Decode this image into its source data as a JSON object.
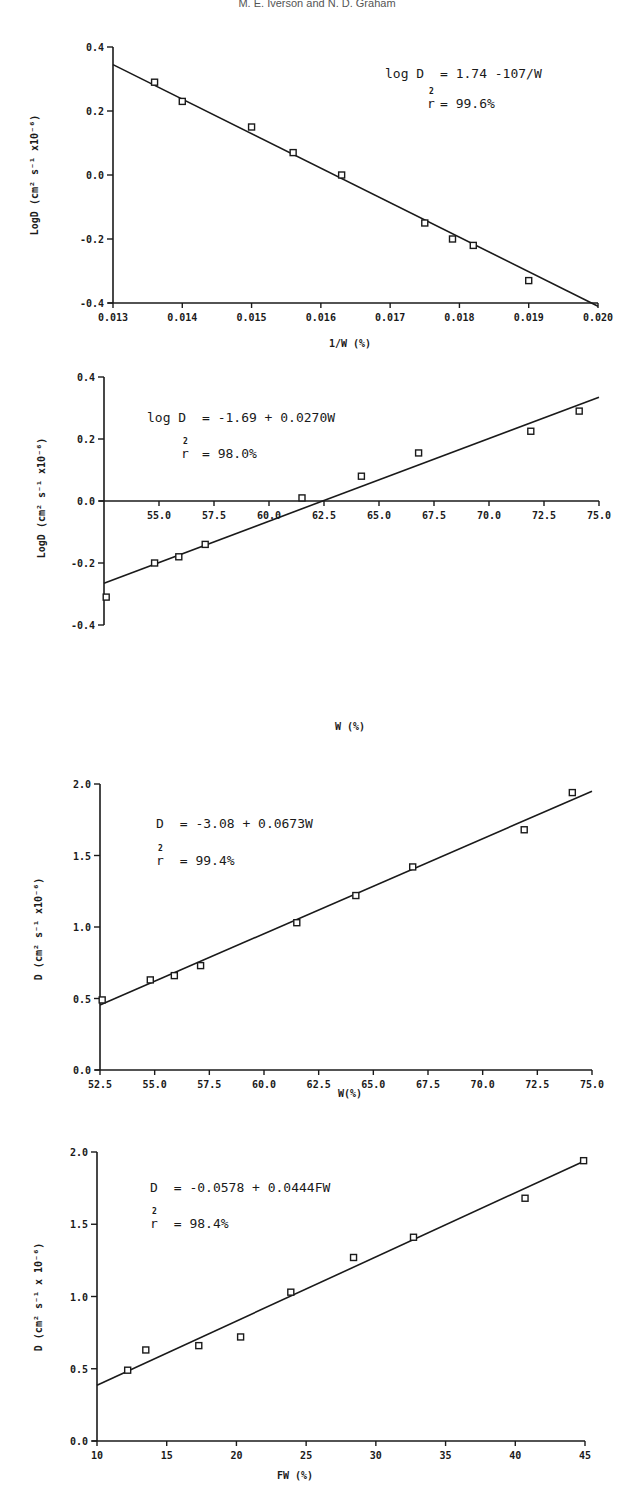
{
  "page": {
    "header_text": "M. E. Iverson and N. D. Graham"
  },
  "chart_data": [
    {
      "type": "scatter",
      "title": "",
      "xlabel": "1/W (%)",
      "ylabel": "LogD (cm² s⁻¹ x10⁻⁶)",
      "xlim": [
        0.013,
        0.02
      ],
      "ylim": [
        -0.4,
        0.4
      ],
      "xticks": [
        0.013,
        0.014,
        0.015,
        0.016,
        0.017,
        0.018,
        0.019,
        0.02
      ],
      "xtick_labels": [
        "0.013",
        "0.014",
        "0.015",
        "0.016",
        "0.017",
        "0.018",
        "0.019",
        "0.020"
      ],
      "yticks": [
        -0.4,
        -0.2,
        0.0,
        0.2,
        0.4
      ],
      "ytick_labels": [
        "-0.4",
        "-0.2",
        "0.0",
        "0.2",
        "0.4"
      ],
      "x_axis_at": -0.4,
      "grid": false,
      "points": {
        "x": [
          0.0136,
          0.014,
          0.015,
          0.0156,
          0.0163,
          0.0175,
          0.0179,
          0.0182,
          0.019
        ],
        "y": [
          0.29,
          0.23,
          0.15,
          0.07,
          0.0,
          -0.15,
          -0.2,
          -0.22,
          -0.33
        ]
      },
      "fit_line": {
        "x": [
          0.013,
          0.02
        ],
        "y": [
          0.345,
          -0.41
        ]
      },
      "annotation": {
        "eq_lhs": "log D",
        "eq_rhs": "= 1.74 -107/W",
        "r2_label": "r",
        "r2_sup": "2",
        "r2_value": "= 99.6%",
        "placement": "top-right"
      }
    },
    {
      "type": "scatter",
      "title": "",
      "xlabel": "W (%)",
      "ylabel": "LogD (cm² s⁻¹ x10⁻⁶)",
      "xlim": [
        52.5,
        75.0
      ],
      "ylim": [
        -0.4,
        0.4
      ],
      "xticks": [
        55.0,
        57.5,
        60.0,
        62.5,
        65.0,
        67.5,
        70.0,
        72.5,
        75.0
      ],
      "xtick_labels": [
        "55.0",
        "57.5",
        "60.0",
        "62.5",
        "65.0",
        "67.5",
        "70.0",
        "72.5",
        "75.0"
      ],
      "yticks": [
        -0.4,
        -0.2,
        0.0,
        0.2,
        0.4
      ],
      "ytick_labels": [
        "-0.4",
        "-0.2",
        "0.0",
        "0.2",
        "0.4"
      ],
      "x_axis_at": 0.0,
      "grid": false,
      "points": {
        "x": [
          52.6,
          54.8,
          55.9,
          57.1,
          61.5,
          64.2,
          66.8,
          71.9,
          74.1
        ],
        "y": [
          -0.31,
          -0.2,
          -0.18,
          -0.14,
          0.01,
          0.08,
          0.155,
          0.225,
          0.29
        ]
      },
      "fit_line": {
        "x": [
          52.5,
          75.0
        ],
        "y": [
          -0.265,
          0.335
        ]
      },
      "annotation": {
        "eq_lhs": "log D",
        "eq_rhs": "= -1.69 + 0.0270W",
        "r2_label": "r",
        "r2_sup": "2",
        "r2_value": "= 98.0%",
        "placement": "top-left"
      }
    },
    {
      "type": "scatter",
      "title": "",
      "xlabel": "W(%)",
      "ylabel": "D (cm² s⁻¹ x10⁻⁶)",
      "xlim": [
        52.5,
        75.0
      ],
      "ylim": [
        0.0,
        2.0
      ],
      "xticks": [
        52.5,
        55.0,
        57.5,
        60.0,
        62.5,
        65.0,
        67.5,
        70.0,
        72.5,
        75.0
      ],
      "xtick_labels": [
        "52.5",
        "55.0",
        "57.5",
        "60.0",
        "62.5",
        "65.0",
        "67.5",
        "70.0",
        "72.5",
        "75.0"
      ],
      "yticks": [
        0.0,
        0.5,
        1.0,
        1.5,
        2.0
      ],
      "ytick_labels": [
        "0.0",
        "0.5",
        "1.0",
        "1.5",
        "2.0"
      ],
      "x_axis_at": 0.0,
      "grid": false,
      "points": {
        "x": [
          52.6,
          54.8,
          55.9,
          57.1,
          61.5,
          64.2,
          66.8,
          71.9,
          74.1
        ],
        "y": [
          0.49,
          0.63,
          0.66,
          0.73,
          1.03,
          1.22,
          1.42,
          1.68,
          1.94
        ]
      },
      "fit_line": {
        "x": [
          52.5,
          75.0
        ],
        "y": [
          0.455,
          1.95
        ]
      },
      "annotation": {
        "eq_lhs": "D",
        "eq_rhs": "= -3.08 + 0.0673W",
        "r2_label": "r",
        "r2_sup": "2",
        "r2_value": "= 99.4%",
        "placement": "top-left"
      }
    },
    {
      "type": "scatter",
      "title": "",
      "xlabel": "FW (%)",
      "ylabel": "D (cm² s⁻¹ x 10⁻⁶)",
      "xlim": [
        10,
        45
      ],
      "ylim": [
        0.0,
        2.0
      ],
      "xticks": [
        10,
        15,
        20,
        25,
        30,
        35,
        40,
        45
      ],
      "xtick_labels": [
        "10",
        "15",
        "20",
        "25",
        "30",
        "35",
        "40",
        "45"
      ],
      "yticks": [
        0.0,
        0.5,
        1.0,
        1.5,
        2.0
      ],
      "ytick_labels": [
        "0.0",
        "0.5",
        "1.0",
        "1.5",
        "2.0"
      ],
      "x_axis_at": 0.0,
      "grid": false,
      "points": {
        "x": [
          12.2,
          13.5,
          17.3,
          20.3,
          23.9,
          28.4,
          32.7,
          40.7,
          44.9
        ],
        "y": [
          0.49,
          0.63,
          0.66,
          0.72,
          1.03,
          1.27,
          1.41,
          1.68,
          1.94
        ]
      },
      "fit_line": {
        "x": [
          10,
          45
        ],
        "y": [
          0.386,
          1.94
        ]
      },
      "annotation": {
        "eq_lhs": "D",
        "eq_rhs": "= -0.0578 + 0.0444FW",
        "r2_label": "r",
        "r2_sup": "2",
        "r2_value": "= 98.4%",
        "placement": "top-left"
      }
    }
  ]
}
